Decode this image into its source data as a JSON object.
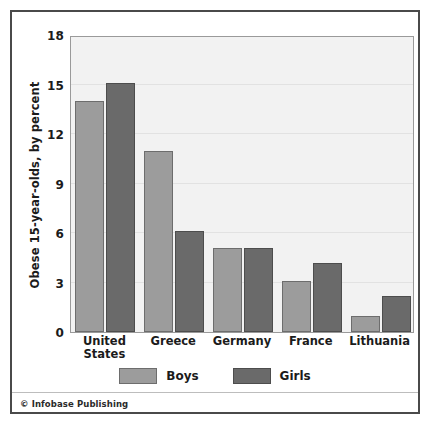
{
  "credit": "© Infobase Publishing",
  "legend": {
    "position": "bottom-center",
    "items": [
      {
        "label": "Boys",
        "color": "#9c9c9c",
        "key": "boys"
      },
      {
        "label": "Girls",
        "color": "#6a6a6a",
        "key": "girls"
      }
    ]
  },
  "axis": {
    "y_title": "Obese 15-year-olds, by percent",
    "y_ticks": [
      0,
      3,
      6,
      9,
      12,
      15,
      18
    ]
  },
  "chart_data": {
    "type": "bar",
    "title": "",
    "subtitle": "",
    "xlabel": "",
    "ylabel": "Obese 15-year-olds, by percent",
    "ylim": [
      0,
      18
    ],
    "yticks": [
      0,
      3,
      6,
      9,
      12,
      15,
      18
    ],
    "grid": true,
    "legend_position": "bottom-center",
    "categories": [
      "United States",
      "Greece",
      "Germany",
      "France",
      "Lithuania"
    ],
    "category_lines": [
      [
        "United",
        "States"
      ],
      [
        "Greece"
      ],
      [
        "Germany"
      ],
      [
        "France"
      ],
      [
        "Lithuania"
      ]
    ],
    "series": [
      {
        "name": "Boys",
        "color": "#9c9c9c",
        "values": [
          14.0,
          11.0,
          5.1,
          3.1,
          1.0
        ]
      },
      {
        "name": "Girls",
        "color": "#6a6a6a",
        "values": [
          15.1,
          6.1,
          5.1,
          4.2,
          2.2
        ]
      }
    ],
    "source": "© Infobase Publishing"
  }
}
